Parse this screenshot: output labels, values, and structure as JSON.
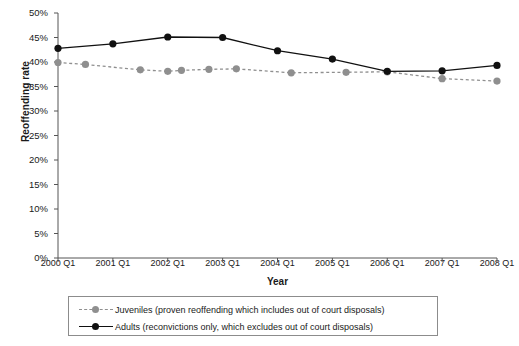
{
  "chart_data": {
    "type": "line",
    "title": "",
    "xlabel": "Year",
    "ylabel": "Reoffending rate",
    "ylim": [
      0,
      50
    ],
    "ytick_labels": [
      "0%",
      "5%",
      "10%",
      "15%",
      "20%",
      "25%",
      "30%",
      "35%",
      "40%",
      "45%",
      "50%"
    ],
    "ytick_values": [
      0,
      5,
      10,
      15,
      20,
      25,
      30,
      35,
      40,
      45,
      50
    ],
    "categories": [
      "2000 Q1",
      "2001 Q1",
      "2002 Q1",
      "2003 Q1",
      "2004 Q1",
      "2005 Q1",
      "2006 Q1",
      "2007 Q1",
      "2008 Q1"
    ],
    "grid": false,
    "legend_position": "bottom",
    "series": [
      {
        "name": "Juveniles (proven reoffending which includes out of court disposals)",
        "short_name": "Juveniles",
        "color": "#8f8f8f",
        "line_style": "dashed",
        "marker": "circle",
        "x": [
          "2000 Q1",
          "2000 Q3",
          "2001 Q3",
          "2002 Q1",
          "2002 Q2",
          "2002 Q4",
          "2003 Q2",
          "2004 Q2",
          "2005 Q2",
          "2006 Q1",
          "2007 Q1",
          "2008 Q1"
        ],
        "x_pos": [
          0,
          0.5,
          1.5,
          2.0,
          2.25,
          2.75,
          3.25,
          4.25,
          5.25,
          6.0,
          7.0,
          8.0
        ],
        "values": [
          39.9,
          39.5,
          38.4,
          38.1,
          38.3,
          38.5,
          38.6,
          37.8,
          37.9,
          38.0,
          36.6,
          36.1
        ]
      },
      {
        "name": "Adults (reconvictions only, which excludes out of court disposals)",
        "short_name": "Adults",
        "color": "#111111",
        "line_style": "solid",
        "marker": "circle",
        "x": [
          "2000 Q1",
          "2001 Q1",
          "2002 Q1",
          "2003 Q1",
          "2004 Q1",
          "2005 Q1",
          "2006 Q1",
          "2007 Q1",
          "2008 Q1"
        ],
        "x_pos": [
          0,
          1,
          2,
          3,
          4,
          5,
          6,
          7,
          8
        ],
        "values": [
          42.8,
          43.7,
          45.1,
          45.0,
          42.3,
          40.6,
          38.1,
          38.2,
          39.3
        ]
      }
    ]
  }
}
